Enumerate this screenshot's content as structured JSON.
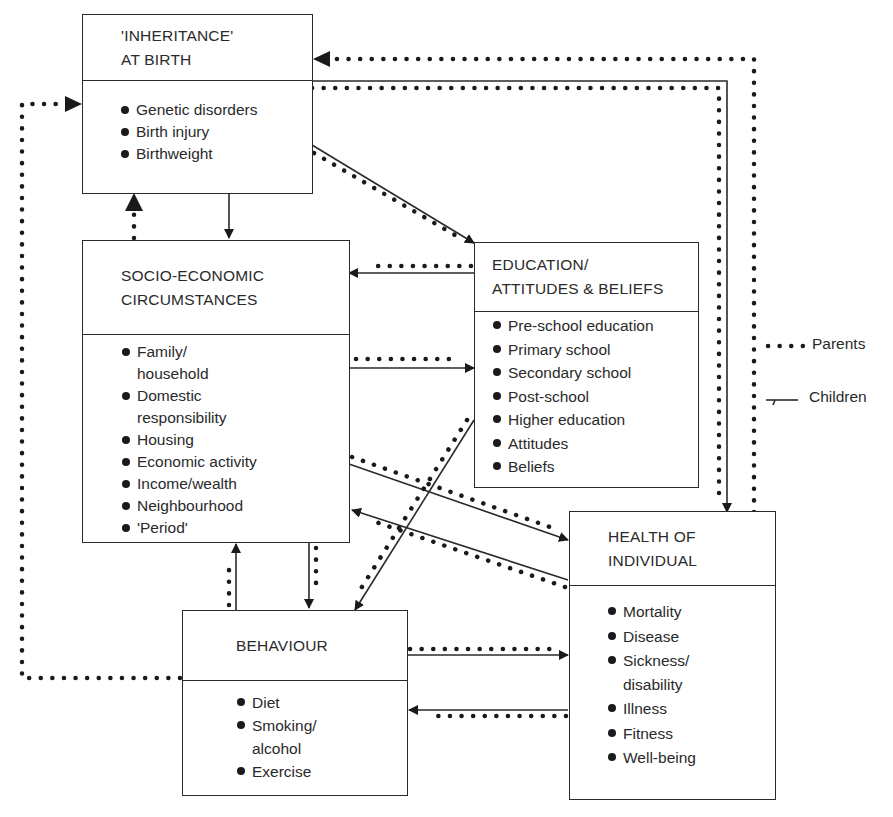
{
  "diagram": {
    "type": "flow-diagram"
  },
  "boxes": {
    "inheritance": {
      "title_lines": [
        "'INHERITANCE'",
        "AT BIRTH"
      ],
      "items": [
        "Genetic disorders",
        "Birth injury",
        "Birthweight"
      ]
    },
    "socio_economic": {
      "title_lines": [
        "SOCIO-ECONOMIC",
        "CIRCUMSTANCES"
      ],
      "items": [
        "Family/\nhousehold",
        "Domestic\nresponsibility",
        "Housing",
        "Economic activity",
        "Income/wealth",
        "Neighbourhood",
        "'Period'"
      ]
    },
    "education": {
      "title_lines": [
        "EDUCATION/",
        "ATTITUDES & BELIEFS"
      ],
      "items": [
        "Pre-school education",
        "Primary school",
        "Secondary school",
        "Post-school",
        "Higher education",
        "Attitudes",
        "Beliefs"
      ]
    },
    "health": {
      "title_lines": [
        "HEALTH OF",
        "INDIVIDUAL"
      ],
      "items": [
        "Mortality",
        "Disease",
        "Sickness/\ndisability",
        "Illness",
        "Fitness",
        "Well-being"
      ]
    },
    "behaviour": {
      "title_lines": [
        "BEHAVIOUR"
      ],
      "items": [
        "Diet",
        "Smoking/\nalcohol",
        "Exercise"
      ]
    }
  },
  "legend": {
    "parents_label": "Parents",
    "children_label": "Children",
    "parents_style": "dotted",
    "children_style": "solid"
  },
  "colors": {
    "line": "#2a2a2a",
    "background": "#ffffff"
  },
  "edges": [
    {
      "from": "Inheritance",
      "to": "Socio-economic",
      "style": "solid"
    },
    {
      "from": "Socio-economic",
      "to": "Inheritance",
      "style": "dotted"
    },
    {
      "from": "Inheritance",
      "to": "Education",
      "style": "solid+dotted"
    },
    {
      "from": "Inheritance",
      "to": "Health",
      "style": "solid+dotted"
    },
    {
      "from": "Health",
      "to": "Inheritance",
      "style": "dotted"
    },
    {
      "from": "Behaviour",
      "to": "Inheritance",
      "style": "dotted"
    },
    {
      "from": "Education",
      "to": "Socio-economic",
      "style": "solid+dotted"
    },
    {
      "from": "Socio-economic",
      "to": "Education",
      "style": "solid+dotted"
    },
    {
      "from": "Socio-economic",
      "to": "Health",
      "style": "solid+dotted"
    },
    {
      "from": "Health",
      "to": "Socio-economic",
      "style": "solid+dotted"
    },
    {
      "from": "Education",
      "to": "Behaviour",
      "style": "solid+dotted"
    },
    {
      "from": "Socio-economic",
      "to": "Behaviour",
      "style": "solid+dotted"
    },
    {
      "from": "Behaviour",
      "to": "Socio-economic",
      "style": "solid+dotted"
    },
    {
      "from": "Behaviour",
      "to": "Health",
      "style": "solid+dotted"
    },
    {
      "from": "Health",
      "to": "Behaviour",
      "style": "solid+dotted"
    }
  ]
}
